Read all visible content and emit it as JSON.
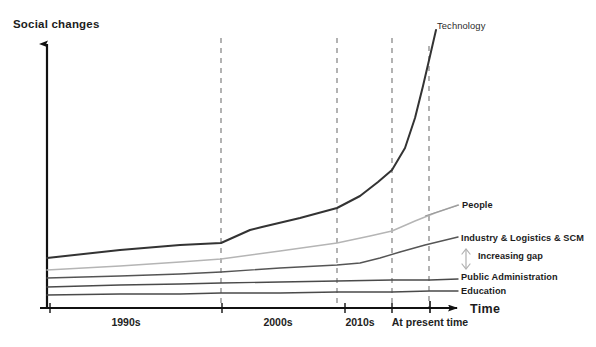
{
  "chart_data": {
    "type": "line",
    "title": "",
    "subtitle": "",
    "xlabel": "Time",
    "ylabel": "Social changes",
    "grid": "vertical-dashed",
    "legend_position": "right-inline-labels",
    "x_tick_labels": [
      "1990s",
      "2000s",
      "2010s",
      "At present time"
    ],
    "x_tick_positions_px": [
      126,
      278,
      360,
      430
    ],
    "vertical_dashed_lines_px": [
      221,
      337,
      392,
      429
    ],
    "axis_ticks_px": [
      50,
      222,
      345,
      392,
      430
    ],
    "annotations": [
      {
        "name": "increasing-gap",
        "text": "Increasing gap",
        "icon": "vertical-double-arrow-icon",
        "x_px": 478,
        "y_px": 252
      }
    ],
    "series": [
      {
        "name": "Technology",
        "label": "Technology",
        "color": "#333333",
        "width": 2.0,
        "points": [
          [
            47,
            258
          ],
          [
            120,
            250
          ],
          [
            180,
            245
          ],
          [
            221,
            243
          ],
          [
            250,
            230
          ],
          [
            262,
            227
          ],
          [
            300,
            218
          ],
          [
            337,
            208
          ],
          [
            360,
            196
          ],
          [
            378,
            182
          ],
          [
            392,
            170
          ],
          [
            405,
            148
          ],
          [
            415,
            118
          ],
          [
            423,
            86
          ],
          [
            430,
            56
          ],
          [
            436,
            30
          ]
        ]
      },
      {
        "name": "People",
        "label": "People",
        "color": "#b5b5b5",
        "width": 1.5,
        "points": [
          [
            47,
            270
          ],
          [
            120,
            266
          ],
          [
            180,
            262
          ],
          [
            221,
            259
          ],
          [
            280,
            251
          ],
          [
            337,
            243
          ],
          [
            370,
            236
          ],
          [
            392,
            231
          ],
          [
            415,
            221
          ],
          [
            435,
            213
          ],
          [
            458,
            205
          ]
        ]
      },
      {
        "name": "Industry & Logistics & SCM",
        "label": "Industry & Logistics & SCM",
        "color": "#555555",
        "width": 1.4,
        "points": [
          [
            47,
            278
          ],
          [
            120,
            276
          ],
          [
            180,
            274
          ],
          [
            221,
            272
          ],
          [
            280,
            268
          ],
          [
            337,
            265
          ],
          [
            360,
            263
          ],
          [
            380,
            258
          ],
          [
            400,
            252
          ],
          [
            425,
            245
          ],
          [
            458,
            237
          ]
        ]
      },
      {
        "name": "Public Administration",
        "label": "Public Administration",
        "color": "#4a4a4a",
        "width": 1.4,
        "points": [
          [
            47,
            287
          ],
          [
            120,
            285
          ],
          [
            180,
            284
          ],
          [
            221,
            283
          ],
          [
            280,
            282
          ],
          [
            337,
            281
          ],
          [
            392,
            280
          ],
          [
            430,
            280
          ],
          [
            458,
            279
          ]
        ]
      },
      {
        "name": "Education",
        "label": "Education",
        "color": "#4a4a4a",
        "width": 1.4,
        "points": [
          [
            47,
            295
          ],
          [
            120,
            294
          ],
          [
            180,
            294
          ],
          [
            221,
            293
          ],
          [
            280,
            293
          ],
          [
            337,
            292
          ],
          [
            392,
            292
          ],
          [
            430,
            291
          ],
          [
            458,
            291
          ]
        ]
      }
    ],
    "axes": {
      "y_axis_x_px": 47,
      "y_axis_top_px": 38,
      "y_axis_bottom_px": 308,
      "x_axis_y_px": 308,
      "x_axis_left_px": 40,
      "x_axis_right_px": 465
    }
  },
  "labels": {
    "y_axis": "Social changes",
    "x_axis": "Time",
    "technology": "Technology",
    "people": "People",
    "industry": "Industry & Logistics & SCM",
    "public_administration": "Public Administration",
    "education": "Education",
    "increasing_gap": "Increasing gap"
  },
  "ticks": {
    "t1": "1990s",
    "t2": "2000s",
    "t3": "2010s",
    "t4": "At present time"
  },
  "colors": {
    "technology": "#333333",
    "people": "#b5b5b5",
    "industry": "#555555",
    "public_administration": "#4a4a4a",
    "education": "#4a4a4a",
    "axis": "#111111",
    "dashed_grid": "#8a8a8a",
    "background": "#ffffff"
  }
}
